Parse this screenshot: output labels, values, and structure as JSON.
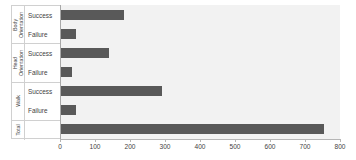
{
  "chart_data": {
    "type": "bar",
    "orientation": "horizontal",
    "title": "",
    "xlabel": "",
    "ylabel": "",
    "xlim": [
      0,
      800
    ],
    "xticks": [
      0,
      100,
      200,
      300,
      400,
      500,
      600,
      700,
      800
    ],
    "grid": false,
    "legend": false,
    "bar_color": "#595959",
    "plot_background": "#f2f2f2",
    "groups": [
      {
        "name": "Body Orientation",
        "label_lines": [
          "Body",
          "Orientation"
        ],
        "rows": [
          {
            "label": "Success",
            "value": 183
          },
          {
            "label": "Failure",
            "value": 46
          }
        ]
      },
      {
        "name": "Head Orientation",
        "label_lines": [
          "Head",
          "Orientation"
        ],
        "rows": [
          {
            "label": "Success",
            "value": 140
          },
          {
            "label": "Failure",
            "value": 34
          }
        ]
      },
      {
        "name": "Walk",
        "label_lines": [
          "Walk"
        ],
        "rows": [
          {
            "label": "Success",
            "value": 292
          },
          {
            "label": "Failure",
            "value": 46
          }
        ]
      },
      {
        "name": "Total",
        "label_lines": [
          "Total"
        ],
        "rows": [
          {
            "label": "",
            "value": 755
          }
        ]
      }
    ],
    "categories": [
      "Body Orientation - Success",
      "Body Orientation - Failure",
      "Head Orientation - Success",
      "Head Orientation - Failure",
      "Walk - Success",
      "Walk - Failure",
      "Total"
    ],
    "values": [
      183,
      46,
      140,
      34,
      292,
      46,
      755
    ]
  }
}
